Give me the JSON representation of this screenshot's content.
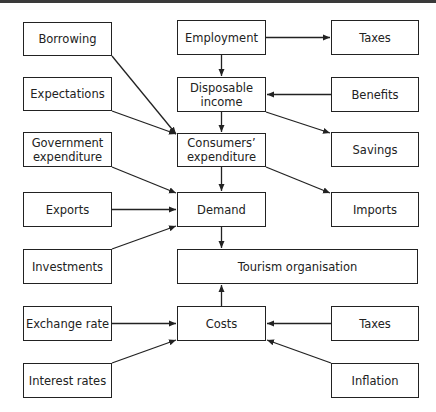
{
  "nodes": {
    "borrowing": "Borrowing",
    "expectations": "Expectations",
    "government_expenditure": "Government\nexpenditure",
    "exports": "Exports",
    "investments": "Investments",
    "exchange_rate": "Exchange rate",
    "interest_rates": "Interest rates",
    "employment": "Employment",
    "disposable_income": "Disposable\nincome",
    "consumers_expenditure": "Consumers’\nexpenditure",
    "demand": "Demand",
    "tourism_organisation": "Tourism organisation",
    "costs": "Costs",
    "taxes_top": "Taxes",
    "benefits": "Benefits",
    "savings": "Savings",
    "imports": "Imports",
    "taxes_bottom": "Taxes",
    "inflation": "Inflation"
  },
  "edges": [
    {
      "from": "employment",
      "to": "taxes_top"
    },
    {
      "from": "employment",
      "to": "disposable_income"
    },
    {
      "from": "benefits",
      "to": "disposable_income"
    },
    {
      "from": "disposable_income",
      "to": "savings"
    },
    {
      "from": "disposable_income",
      "to": "consumers_expenditure"
    },
    {
      "from": "borrowing",
      "to": "consumers_expenditure"
    },
    {
      "from": "expectations",
      "to": "consumers_expenditure"
    },
    {
      "from": "consumers_expenditure",
      "to": "imports"
    },
    {
      "from": "consumers_expenditure",
      "to": "demand"
    },
    {
      "from": "government_expenditure",
      "to": "demand"
    },
    {
      "from": "exports",
      "to": "demand"
    },
    {
      "from": "investments",
      "to": "demand"
    },
    {
      "from": "demand",
      "to": "tourism_organisation"
    },
    {
      "from": "costs",
      "to": "tourism_organisation"
    },
    {
      "from": "exchange_rate",
      "to": "costs"
    },
    {
      "from": "interest_rates",
      "to": "costs"
    },
    {
      "from": "taxes_bottom",
      "to": "costs"
    },
    {
      "from": "inflation",
      "to": "costs"
    }
  ]
}
